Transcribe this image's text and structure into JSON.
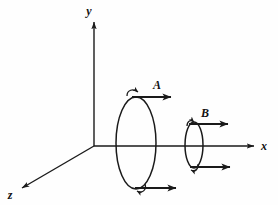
{
  "figure": {
    "background_color": "#fefefe",
    "ink_color": "#1a1a1a",
    "width": 278,
    "height": 205,
    "origin": {
      "x": 94,
      "y": 146
    }
  },
  "axes": [
    {
      "id": "y",
      "label": "y",
      "direction": "up",
      "from": {
        "x": 94,
        "y": 146
      },
      "to": {
        "x": 94,
        "y": 20
      },
      "label_pos": {
        "x": 89,
        "y": 14
      },
      "arrowhead": true
    },
    {
      "id": "x",
      "label": "x",
      "direction": "right",
      "from": {
        "x": 94,
        "y": 146
      },
      "to": {
        "x": 256,
        "y": 146
      },
      "label_pos": {
        "x": 262,
        "y": 150
      },
      "arrowhead": true
    },
    {
      "id": "z",
      "label": "z",
      "direction": "down-left",
      "from": {
        "x": 94,
        "y": 146
      },
      "to": {
        "x": 20,
        "y": 189
      },
      "label_pos": {
        "x": 8,
        "y": 199
      },
      "arrowhead": true
    }
  ],
  "loops": [
    {
      "id": "A",
      "label": "A",
      "label_pos": {
        "x": 156,
        "y": 88
      },
      "center": {
        "x": 136,
        "y": 143
      },
      "radius_x": 20,
      "radius_y": 46,
      "current_vectors": [
        {
          "id": "A-top",
          "from": {
            "x": 138,
            "y": 97
          },
          "to": {
            "x": 176,
            "y": 97
          }
        },
        {
          "id": "A-bottom",
          "from": {
            "x": 140,
            "y": 187
          },
          "to": {
            "x": 180,
            "y": 187
          }
        }
      ],
      "curl_arrows": [
        {
          "id": "A-top-curl",
          "at": {
            "x": 134,
            "y": 94
          },
          "sense": "counterclockwise"
        },
        {
          "id": "A-bottom-curl",
          "at": {
            "x": 140,
            "y": 190
          },
          "sense": "counterclockwise"
        }
      ]
    },
    {
      "id": "B",
      "label": "B",
      "label_pos": {
        "x": 204,
        "y": 116
      },
      "center": {
        "x": 194,
        "y": 145
      },
      "radius_x": 9,
      "radius_y": 23,
      "current_vectors": [
        {
          "id": "B-top",
          "from": {
            "x": 191,
            "y": 124
          },
          "to": {
            "x": 232,
            "y": 124
          }
        },
        {
          "id": "B-bottom",
          "from": {
            "x": 192,
            "y": 167
          },
          "to": {
            "x": 234,
            "y": 167
          }
        }
      ],
      "curl_arrows": [
        {
          "id": "B-top-curl",
          "at": {
            "x": 190,
            "y": 122
          },
          "sense": "counterclockwise"
        },
        {
          "id": "B-bottom-curl",
          "at": {
            "x": 192,
            "y": 170
          },
          "sense": "counterclockwise"
        }
      ]
    }
  ]
}
